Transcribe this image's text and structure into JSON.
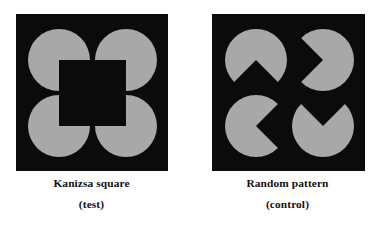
{
  "figure": {
    "background_color": "#ffffff",
    "width": 379,
    "height": 231,
    "inducer_color": "#a8a8a8",
    "field_color": "#0b0b0b",
    "caption_color": "#111111"
  },
  "panels": [
    {
      "id": "kanizsa-square",
      "caption_main": "Kanizsa square",
      "caption_sub": "(test)",
      "field": {
        "x": 0,
        "y": 0,
        "width": 152,
        "height": 157
      },
      "inducers": [
        {
          "name": "inducer-top-left",
          "cx": 43,
          "cy": 46,
          "r": 31,
          "wedge_direction": "down-right",
          "wedge_start_deg": 0,
          "wedge_end_deg": 90
        },
        {
          "name": "inducer-top-right",
          "cx": 110,
          "cy": 46,
          "r": 31,
          "wedge_direction": "down-left",
          "wedge_start_deg": 90,
          "wedge_end_deg": 180
        },
        {
          "name": "inducer-bottom-left",
          "cx": 43,
          "cy": 112,
          "r": 31,
          "wedge_direction": "up-right",
          "wedge_start_deg": 270,
          "wedge_end_deg": 360
        },
        {
          "name": "inducer-bottom-right",
          "cx": 110,
          "cy": 112,
          "r": 31,
          "wedge_direction": "up-left",
          "wedge_start_deg": 180,
          "wedge_end_deg": 270
        }
      ],
      "illusory_contour": "square"
    },
    {
      "id": "random-pattern",
      "caption_main": "Random pattern",
      "caption_sub": "(control)",
      "field": {
        "x": 0,
        "y": 0,
        "width": 153,
        "height": 157
      },
      "inducers": [
        {
          "name": "inducer-top-left",
          "cx": 44,
          "cy": 46,
          "r": 31,
          "wedge_direction": "down",
          "wedge_start_deg": 45,
          "wedge_end_deg": 135
        },
        {
          "name": "inducer-top-right",
          "cx": 111,
          "cy": 46,
          "r": 31,
          "wedge_direction": "left",
          "wedge_start_deg": 135,
          "wedge_end_deg": 225
        },
        {
          "name": "inducer-bottom-left",
          "cx": 44,
          "cy": 112,
          "r": 31,
          "wedge_direction": "right",
          "wedge_start_deg": 315,
          "wedge_end_deg": 405
        },
        {
          "name": "inducer-bottom-right",
          "cx": 111,
          "cy": 112,
          "r": 31,
          "wedge_direction": "up",
          "wedge_start_deg": 225,
          "wedge_end_deg": 315
        }
      ],
      "illusory_contour": "none"
    }
  ]
}
